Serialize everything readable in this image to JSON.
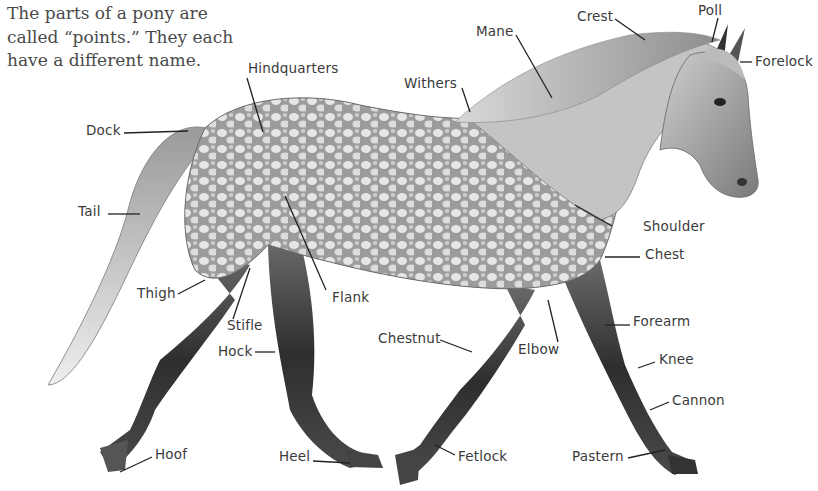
{
  "intro": {
    "lines": [
      "The parts of a pony are",
      "called “points.” They each",
      "have a different name."
    ]
  },
  "colors": {
    "text": "#3a3a3a",
    "intro_text": "#4a4a4a",
    "coat_light": "#e2e2e2",
    "coat_mid": "#a8a8a8",
    "coat_dark": "#3c3c3c",
    "leader_line": "#222222",
    "background": "#ffffff"
  },
  "labels": {
    "crest": "Crest",
    "poll": "Poll",
    "mane": "Mane",
    "forelock": "Forelock",
    "hindquarters": "Hindquarters",
    "withers": "Withers",
    "dock": "Dock",
    "tail": "Tail",
    "shoulder": "Shoulder",
    "chest": "Chest",
    "thigh": "Thigh",
    "flank": "Flank",
    "stifle": "Stifle",
    "forearm": "Forearm",
    "chestnut": "Chestnut",
    "hock": "Hock",
    "elbow": "Elbow",
    "knee": "Knee",
    "cannon": "Cannon",
    "hoof": "Hoof",
    "heel": "Heel",
    "fetlock": "Fetlock",
    "pastern": "Pastern"
  },
  "illustration": {
    "subject": "dapple-grey pony, trotting, facing right",
    "style": "pencil drawing"
  }
}
